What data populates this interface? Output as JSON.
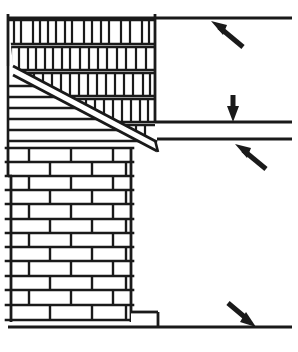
{
  "figure": {
    "title": "Masonry cavity wall section with stepped flashing",
    "width": 298,
    "height": 352,
    "background_color": "#ffffff",
    "line_color": "#1a1a1a",
    "brick_face_color": "#ffffff"
  },
  "regions": {
    "upper_wall": {
      "name": "Soldier course brick veneer",
      "bond": "stacked vertical (soldier) course",
      "left": 8,
      "right": 155,
      "top": 12,
      "bottom": 140,
      "course_count": 5,
      "course_height": 26,
      "brick_width": 13
    },
    "lower_wall": {
      "name": "Running bond brick wall",
      "bond": "running bond (half lap)",
      "left": 8,
      "right": 131,
      "top": 145,
      "bottom": 322,
      "course_count": 12,
      "course_height": 15,
      "brick_width": 42
    },
    "flashing": {
      "name": "Stepped diagonal flashing band",
      "start_x": 13,
      "start_y": 66,
      "end_x": 157,
      "end_y": 142,
      "band_width": 9
    },
    "mortar_band": {
      "name": "Horizontal mortar course band below flashing",
      "line_count": 6,
      "left": 8,
      "top": 84,
      "bottom": 142
    },
    "footing_step": {
      "name": "Footing step at wall base",
      "left": 131,
      "right": 158,
      "top": 312,
      "bottom": 327
    }
  },
  "horizontal_lines": [
    {
      "id": "roof-line",
      "label": "Upper roof / ceiling line",
      "y": 18,
      "x1": 8,
      "x2": 292
    },
    {
      "id": "upper-deck-line",
      "label": "Upper deck line",
      "y": 122,
      "x1": 155,
      "x2": 292
    },
    {
      "id": "lower-deck-line",
      "label": "Lower deck line",
      "y": 139,
      "x1": 157,
      "x2": 292
    },
    {
      "id": "ground-line",
      "label": "Ground / slab line",
      "y": 327,
      "x1": 8,
      "x2": 292
    }
  ],
  "arrows": [
    {
      "id": "arrow-top-right",
      "label": "Arrow pointing up-left at roof line",
      "direction": "up-left",
      "tip_x": 214,
      "tip_y": 23,
      "tail_x": 243,
      "tail_y": 47
    },
    {
      "id": "arrow-middle-down",
      "label": "Arrow pointing down at upper deck line",
      "direction": "down",
      "tip_x": 233,
      "tip_y": 120,
      "tail_x": 233,
      "tail_y": 95
    },
    {
      "id": "arrow-middle-upleft",
      "label": "Arrow pointing up-left at lower deck line",
      "direction": "up-left",
      "tip_x": 238,
      "tip_y": 146,
      "tail_x": 265,
      "tail_y": 168
    },
    {
      "id": "arrow-bottom-right",
      "label": "Arrow pointing down-right at ground line",
      "direction": "down-right",
      "tip_x": 252,
      "tip_y": 325,
      "tail_x": 228,
      "tail_y": 303
    }
  ]
}
